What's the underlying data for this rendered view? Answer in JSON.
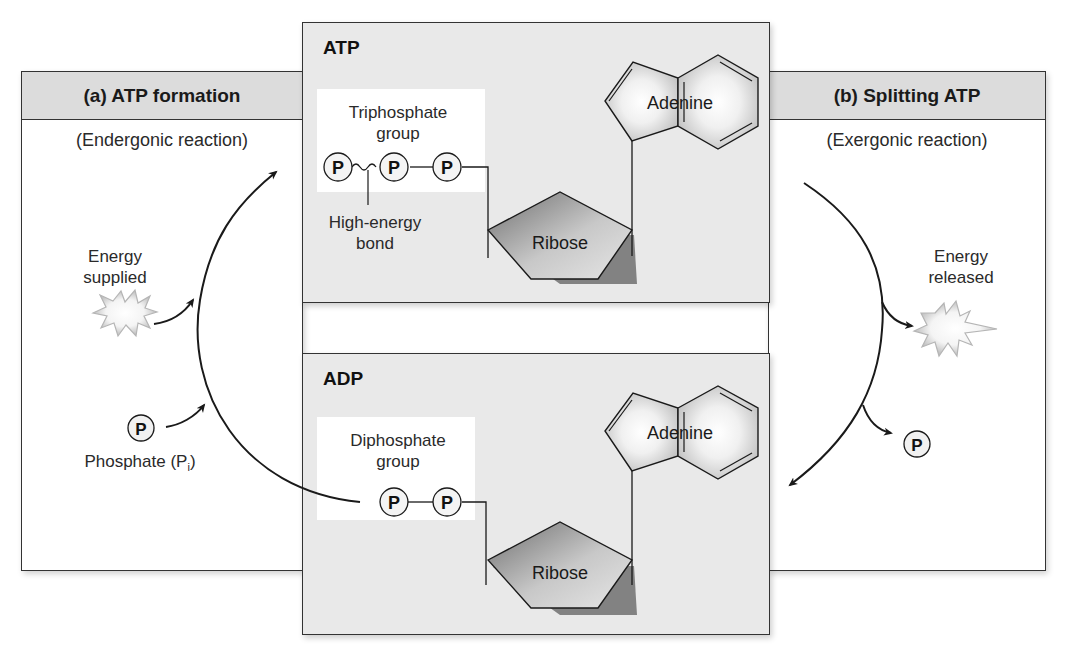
{
  "left_panel": {
    "title": "(a) ATP formation",
    "subtitle": "(Endergonic reaction)",
    "energy_label_line1": "Energy",
    "energy_label_line2": "supplied",
    "phosphate_symbol": "P",
    "phosphate_label": "Phosphate (P",
    "phosphate_subscript": "i",
    "phosphate_close": ")"
  },
  "right_panel": {
    "title": "(b) Splitting ATP",
    "subtitle": "(Exergonic reaction)",
    "energy_label_line1": "Energy",
    "energy_label_line2": "released",
    "phosphate_symbol": "P"
  },
  "atp_box": {
    "title": "ATP",
    "group_label_line1": "Triphosphate",
    "group_label_line2": "group",
    "phosphates": [
      "P",
      "P",
      "P"
    ],
    "bond_label_line1": "High-energy",
    "bond_label_line2": "bond",
    "sugar_label": "Ribose",
    "base_label": "Adenine"
  },
  "adp_box": {
    "title": "ADP",
    "group_label_line1": "Diphosphate",
    "group_label_line2": "group",
    "phosphates": [
      "P",
      "P"
    ],
    "sugar_label": "Ribose",
    "base_label": "Adenine"
  },
  "colors": {
    "header_gray": "#dcdcdc",
    "box_gray": "#e9e9e9",
    "ribose_dark": "#7a7a7a",
    "ribose_light": "#d8d8d8",
    "adenine_fill": "#cfcfcf",
    "burst": "#bdbdbd",
    "line": "#1a1a1a"
  }
}
